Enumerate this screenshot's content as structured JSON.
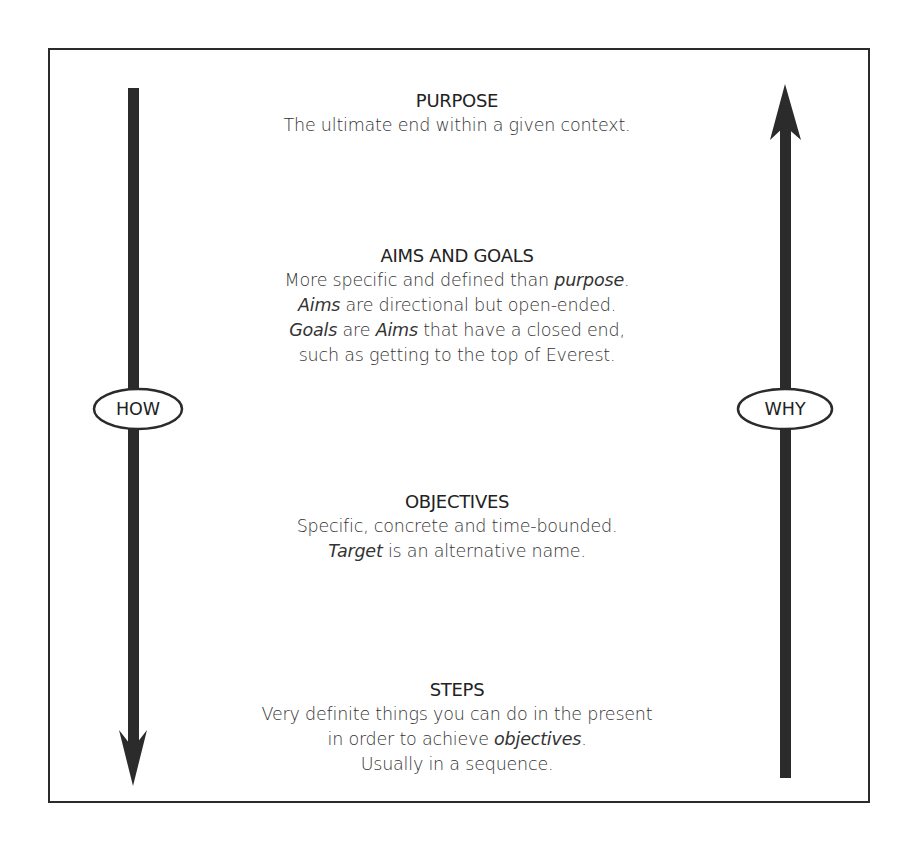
{
  "diagram": {
    "sections": [
      {
        "id": "purpose",
        "heading": "PURPOSE",
        "lines": [
          [
            {
              "text": "The ultimate end within a given context.",
              "italic": false
            }
          ]
        ]
      },
      {
        "id": "aims-and-goals",
        "heading": "AIMS AND GOALS",
        "lines": [
          [
            {
              "text": "More specific and defined than ",
              "italic": false
            },
            {
              "text": "purpose",
              "italic": true
            },
            {
              "text": ".",
              "italic": false
            }
          ],
          [
            {
              "text": "Aims",
              "italic": true
            },
            {
              "text": " are directional but open-ended.",
              "italic": false
            }
          ],
          [
            {
              "text": "Goals",
              "italic": true
            },
            {
              "text": " are ",
              "italic": false
            },
            {
              "text": "Aims",
              "italic": true
            },
            {
              "text": " that have a closed end,",
              "italic": false
            }
          ],
          [
            {
              "text": "such as getting to the top of Everest.",
              "italic": false
            }
          ]
        ]
      },
      {
        "id": "objectives",
        "heading": "OBJECTIVES",
        "lines": [
          [
            {
              "text": "Specific, concrete and time-bounded.",
              "italic": false
            }
          ],
          [
            {
              "text": "Target",
              "italic": true
            },
            {
              "text": " is an alternative name.",
              "italic": false
            }
          ]
        ]
      },
      {
        "id": "steps",
        "heading": "STEPS",
        "lines": [
          [
            {
              "text": "Very definite things you can do in the present",
              "italic": false
            }
          ],
          [
            {
              "text": "in order to achieve ",
              "italic": false
            },
            {
              "text": "objectives",
              "italic": true
            },
            {
              "text": ".",
              "italic": false
            }
          ],
          [
            {
              "text": "Usually in a sequence.",
              "italic": false
            }
          ]
        ]
      }
    ],
    "left_arrow": {
      "direction": "down",
      "label": "HOW"
    },
    "right_arrow": {
      "direction": "up",
      "label": "WHY"
    },
    "colors": {
      "ink": "#2b2b2b",
      "text": "#333333",
      "background": "#ffffff"
    }
  }
}
